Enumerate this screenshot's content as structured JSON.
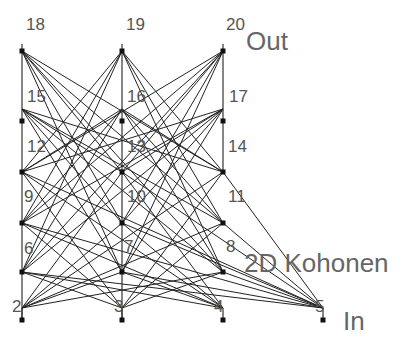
{
  "diagram": {
    "type": "neural-network",
    "colors": {
      "edge": "#222222",
      "column": "#333333",
      "node": "#111111",
      "text": "#555555",
      "background": "#ffffff"
    },
    "layers": [
      {
        "name": "Out",
        "label": "Out",
        "label_pos": [
          246,
          28
        ]
      },
      {
        "name": "2D Kohonen",
        "label": "2D Kohonen",
        "label_pos": [
          244,
          250
        ]
      },
      {
        "name": "In",
        "label": "In",
        "label_pos": [
          343,
          308
        ]
      }
    ],
    "columns": [
      {
        "x": 22,
        "top": 44,
        "bottom": 320
      },
      {
        "x": 122,
        "top": 44,
        "bottom": 320
      },
      {
        "x": 223,
        "top": 44,
        "bottom": 172
      }
    ],
    "nodes": [
      {
        "id": "2",
        "layer": "In",
        "marker": [
          22,
          320
        ],
        "hub": [
          22,
          308
        ],
        "label_pos": [
          12,
          298
        ]
      },
      {
        "id": "3",
        "layer": "In",
        "marker": [
          122,
          320
        ],
        "hub": [
          122,
          308
        ],
        "label_pos": [
          114,
          298
        ]
      },
      {
        "id": "4",
        "layer": "In",
        "marker": [
          223,
          320
        ],
        "hub": [
          223,
          308
        ],
        "label_pos": [
          214,
          298
        ]
      },
      {
        "id": "5",
        "layer": "In",
        "marker": [
          323,
          320
        ],
        "hub": [
          323,
          308
        ],
        "label_pos": [
          315,
          298
        ]
      },
      {
        "id": "6",
        "layer": "2D Kohonen",
        "marker": [
          22,
          272
        ],
        "hub": [
          22,
          272
        ],
        "label_pos": [
          24,
          240
        ]
      },
      {
        "id": "7",
        "layer": "2D Kohonen",
        "marker": [
          122,
          272
        ],
        "hub": [
          122,
          272
        ],
        "label_pos": [
          124,
          238
        ]
      },
      {
        "id": "8",
        "layer": "2D Kohonen",
        "marker": [
          223,
          272
        ],
        "hub": [
          223,
          272
        ],
        "label_pos": [
          226,
          238
        ]
      },
      {
        "id": "9",
        "layer": "2D Kohonen",
        "marker": [
          22,
          223
        ],
        "hub": [
          22,
          223
        ],
        "label_pos": [
          24,
          188
        ]
      },
      {
        "id": "10",
        "layer": "2D Kohonen",
        "marker": [
          122,
          223
        ],
        "hub": [
          122,
          223
        ],
        "label_pos": [
          127,
          188
        ]
      },
      {
        "id": "11",
        "layer": "2D Kohonen",
        "marker": [
          223,
          223
        ],
        "hub": [
          223,
          223
        ],
        "label_pos": [
          228,
          188
        ]
      },
      {
        "id": "12",
        "layer": "2D Kohonen",
        "marker": [
          22,
          172
        ],
        "hub": [
          22,
          172
        ],
        "label_pos": [
          27,
          138
        ]
      },
      {
        "id": "13",
        "layer": "2D Kohonen",
        "marker": [
          122,
          172
        ],
        "hub": [
          122,
          172
        ],
        "label_pos": [
          127,
          138
        ]
      },
      {
        "id": "14",
        "layer": "2D Kohonen",
        "marker": [
          223,
          172
        ],
        "hub": [
          223,
          172
        ],
        "label_pos": [
          228,
          138
        ]
      },
      {
        "id": "15",
        "layer": "Out",
        "marker": [
          22,
          121
        ],
        "hub": [
          22,
          109
        ],
        "label_pos": [
          27,
          88
        ]
      },
      {
        "id": "16",
        "layer": "Out",
        "marker": [
          122,
          121
        ],
        "hub": [
          122,
          109
        ],
        "label_pos": [
          127,
          88
        ]
      },
      {
        "id": "17",
        "layer": "Out",
        "marker": [
          223,
          121
        ],
        "hub": [
          223,
          109
        ],
        "label_pos": [
          229,
          88
        ]
      },
      {
        "id": "18",
        "layer": "Out",
        "marker": [
          22,
          51
        ],
        "hub": [
          22,
          51
        ],
        "label_pos": [
          26,
          16
        ]
      },
      {
        "id": "19",
        "layer": "Out",
        "marker": [
          122,
          51
        ],
        "hub": [
          122,
          51
        ],
        "label_pos": [
          126,
          16
        ]
      },
      {
        "id": "20",
        "layer": "Out",
        "marker": [
          223,
          51
        ],
        "hub": [
          223,
          51
        ],
        "label_pos": [
          226,
          16
        ]
      }
    ],
    "edges_from_inputs": [
      "2",
      "3",
      "4",
      "5"
    ],
    "edges_to_kohonen": [
      "6",
      "7",
      "8",
      "9",
      "10",
      "11",
      "12",
      "13",
      "14"
    ],
    "edges_from_kohonen_to": [
      "15",
      "16",
      "17",
      "18",
      "19",
      "20"
    ]
  }
}
